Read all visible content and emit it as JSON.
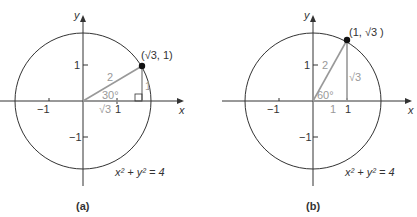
{
  "header": {
    "partial_text": "igure"
  },
  "panels": [
    {
      "id": "a",
      "caption": "(a)",
      "x_axis_label": "x",
      "y_axis_label": "y",
      "tick_labels": {
        "x_neg": "−1",
        "x_pos": "1",
        "y_pos": "1",
        "y_neg": "−1"
      },
      "point_label": "(√3, 1)",
      "hypotenuse_label": "2",
      "angle_label": "30°",
      "opposite_label": "1",
      "adjacent_label": "√3",
      "equation": "x² + y² = 4"
    },
    {
      "id": "b",
      "caption": "(b)",
      "x_axis_label": "x",
      "y_axis_label": "y",
      "tick_labels": {
        "x_neg": "−1",
        "x_pos": "1",
        "y_pos": "1",
        "y_neg": "−1"
      },
      "point_label": "(1, √3 )",
      "hypotenuse_label": "2",
      "angle_label": "60°",
      "opposite_label": "√3",
      "adjacent_label": "1",
      "equation": "x² + y² = 4"
    }
  ],
  "colors": {
    "axis": "#333333",
    "triangle": "#999999"
  }
}
